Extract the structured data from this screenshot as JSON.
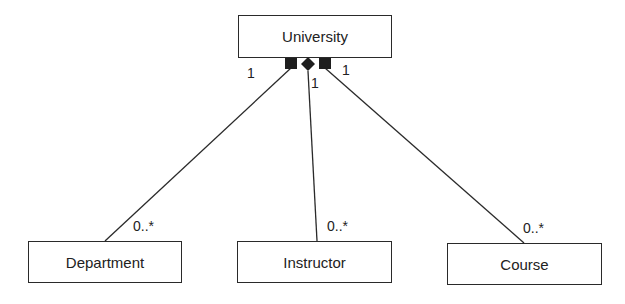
{
  "diagram": {
    "type": "UML class diagram (composition)",
    "whole": {
      "name": "University"
    },
    "parts": [
      {
        "name": "Department",
        "whole_multiplicity": "1",
        "part_multiplicity": "0..*"
      },
      {
        "name": "Instructor",
        "whole_multiplicity": "1",
        "part_multiplicity": "0..*"
      },
      {
        "name": "Course",
        "whole_multiplicity": "1",
        "part_multiplicity": "0..*"
      }
    ],
    "colors": {
      "stroke": "#2a2a2a",
      "fill": "#1e1e1e",
      "background": "#ffffff"
    }
  }
}
